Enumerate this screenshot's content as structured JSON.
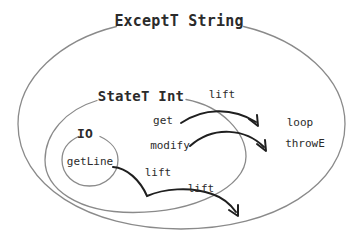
{
  "diagram": {
    "title": "ExceptT String",
    "monads": [
      {
        "name": "ExceptT String",
        "level": "outer",
        "label_x": 179,
        "label_y": 21
      },
      {
        "name": "StateT Int",
        "level": "middle",
        "label_x": 141,
        "label_y": 96
      },
      {
        "name": "IO",
        "level": "inner",
        "label_x": 85,
        "label_y": 133
      }
    ],
    "operations": [
      {
        "name": "getLine",
        "owner": "IO",
        "x": 90,
        "y": 161
      },
      {
        "name": "get",
        "owner": "StateT Int",
        "x": 163,
        "y": 120
      },
      {
        "name": "modify",
        "owner": "StateT Int",
        "x": 170,
        "y": 145
      },
      {
        "name": "loop",
        "owner": "ExceptT String",
        "x": 300,
        "y": 122
      },
      {
        "name": "throwE",
        "owner": "ExceptT String",
        "x": 305,
        "y": 143
      }
    ],
    "arrow_labels": [
      {
        "text": "lift",
        "x": 222,
        "y": 94,
        "arrow": "get-to-exceptT"
      },
      {
        "text": "lift",
        "x": 158,
        "y": 172,
        "arrow": "io-to-stateT"
      },
      {
        "text": "lift",
        "x": 201,
        "y": 188,
        "arrow": "stateT-to-exceptT"
      }
    ],
    "colors": {
      "background": "#ffffff",
      "ellipse_stroke": "#8a8a8a",
      "arrow_stroke": "#1f1f1f",
      "text": "#2b2b2b"
    }
  }
}
